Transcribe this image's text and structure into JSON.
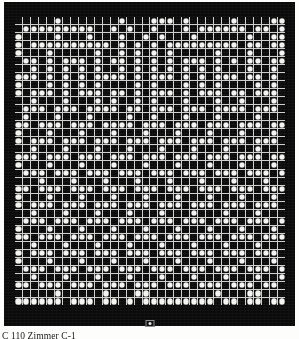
{
  "figure": {
    "kind": "dot-matrix-pattern-plate",
    "caption": "C 110  Zimmer C-1",
    "registration_mark_name": "center-registration-mark",
    "colors": {
      "plate_background": "#0a0a0a",
      "cell_background": "#0c0c0c",
      "grid_line": "#cfcfcf",
      "dot": "#f4f4f0",
      "page": "#fdfdfb",
      "caption_text": "#1a1a1a"
    },
    "grid": {
      "columns": 34,
      "rows": 36,
      "legend": {
        "1": "filled-dot",
        "0": "empty-cell"
      },
      "rows_data": [
        "0000010000000100011101000001000011",
        "0111111111001010010001011111101101",
        "1000010001000100101000100000010011",
        "1011111111110101010111111111011011",
        "1000100000100101010100000100010001",
        "0110101110101101010101110101011011",
        "0010101010100101010101010100010010",
        "1110101010111101011101010111011010",
        "1000101010100001010001010100001010",
        "1011101011101101011101011101101110",
        "0010001000101001010001000100100010",
        "0111011101111011011101110111101110",
        "0100010001000010010001000100001000",
        "1101110111011110111011101110111011",
        "1000100010001000100010001000100010",
        "1011101110111011101110111011101110",
        "0010001000100010001000100010001000",
        "1110111011101110111011101110111011",
        "1000100010001000100010001000100010",
        "0111011101110111011101110111011101",
        "0001000100010001000100010001000100",
        "1101110111011101110111011101110111",
        "1000100010001000100010001000100010",
        "1011101110111011101110111011101110",
        "0010001000100010001000100010001000",
        "0111011101110111011101110111011101",
        "1000100010001000100010001000100010",
        "1101110111011101110111011101110111",
        "0010001000100010001000100010001000",
        "1011101110111011101110111011101110",
        "1000100010001000100010001000100010",
        "0111011101110111011101110111011101",
        "0010001000100010001000100010001001",
        "1101110111011101110111011101110110",
        "0000010000010001100000000100011000",
        "1111110111011010111111111011011011"
      ]
    }
  }
}
